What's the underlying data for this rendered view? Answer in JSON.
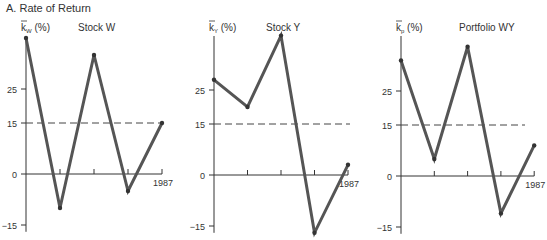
{
  "header": {
    "title": "A.  Rate of Return"
  },
  "chart_data": [
    {
      "type": "line",
      "title": "Stock W",
      "ylabel": "k̅W (%)",
      "ylabel_main": "k",
      "ylabel_sub": "W",
      "ylabel_unit": "(%)",
      "x": [
        1983,
        1984,
        1985,
        1986,
        1987
      ],
      "x_tick_labels": [
        "",
        "",
        "",
        "",
        "1987"
      ],
      "values": [
        40,
        -10,
        35,
        -5,
        15
      ],
      "y_ticks": [
        25,
        15,
        0,
        -15
      ],
      "mean_line": 15,
      "ylim": [
        -17,
        40
      ]
    },
    {
      "type": "line",
      "title": "Stock Y",
      "ylabel": "k̅Y (%)",
      "ylabel_main": "k",
      "ylabel_sub": "Y",
      "ylabel_unit": "(%)",
      "x": [
        1983,
        1984,
        1985,
        1986,
        1987
      ],
      "x_tick_labels": [
        "",
        "",
        "",
        "",
        "1987"
      ],
      "values": [
        28,
        20,
        41,
        -17,
        3
      ],
      "y_ticks": [
        25,
        15,
        0,
        -15
      ],
      "mean_line": 15,
      "ylim": [
        -17,
        41
      ]
    },
    {
      "type": "line",
      "title": "Portfolio WY",
      "ylabel": "k̅p (%)",
      "ylabel_main": "k",
      "ylabel_sub": "p",
      "ylabel_unit": "(%)",
      "x": [
        1983,
        1984,
        1985,
        1986,
        1987
      ],
      "x_tick_labels": [
        "",
        "",
        "",
        "",
        "1987"
      ],
      "values": [
        34,
        5,
        38,
        -11,
        9
      ],
      "y_ticks": [
        25,
        15,
        0,
        -15
      ],
      "mean_line": 15,
      "ylim": [
        -17,
        41
      ]
    }
  ],
  "style": {
    "line_color": "#555555",
    "axis_color": "#333333",
    "dash_color": "#444444"
  }
}
